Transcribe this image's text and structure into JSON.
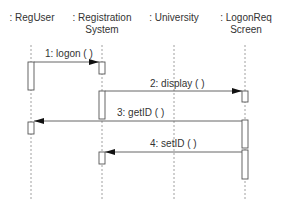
{
  "diagram": {
    "type": "uml-sequence",
    "objects": [
      {
        "id": "reguser",
        "line1": ": RegUser",
        "line2": "",
        "x": 31
      },
      {
        "id": "regsys",
        "line1": ": Registration",
        "line2": "System",
        "x": 102
      },
      {
        "id": "university",
        "line1": ": University",
        "line2": "",
        "x": 174
      },
      {
        "id": "logonreq",
        "line1": ": LogonReq",
        "line2": "Screen",
        "x": 245
      }
    ],
    "messages": [
      {
        "label": "1: logon ( )",
        "from": "reguser",
        "to": "regsys",
        "y": 62
      },
      {
        "label": "2: display ( )",
        "from": "regsys",
        "to": "logonreq",
        "y": 91
      },
      {
        "label": "3: getID ( )",
        "from": "logonreq",
        "to": "reguser",
        "y": 121
      },
      {
        "label": "4: setID ( )",
        "from": "logonreq",
        "to": "regsys",
        "y": 152
      }
    ],
    "colors": {
      "line": "#555555",
      "lifeline": "#888888",
      "box_fill": "#ffffff"
    }
  }
}
